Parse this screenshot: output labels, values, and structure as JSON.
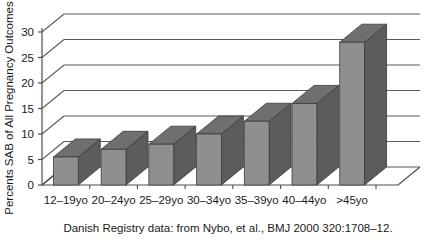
{
  "chart_data": {
    "type": "bar",
    "title": "",
    "subtitle": "",
    "xlabel": "",
    "ylabel": "Percents SAB of All Pregnancy Outcomes",
    "categories": [
      "12–19yo",
      "20–24yo",
      "25–29yo",
      "30–34yo",
      "35–39yo",
      "40–44yo",
      ">45yo"
    ],
    "values": [
      5.5,
      7,
      8,
      10,
      12.5,
      16,
      28
    ],
    "ylim": [
      0,
      30
    ],
    "yticks": [
      0,
      5,
      10,
      15,
      20,
      25,
      30
    ],
    "ytick_labels": [
      "0",
      "5",
      "10",
      "15",
      "20",
      "25",
      "30"
    ],
    "grid": true,
    "legend": false,
    "legend_position": "none",
    "annotations": [
      "Danish Registry data: from Nybo, et al., BMJ 2000 320:1708–12."
    ],
    "style": "3d-column",
    "bar_face_color": "#8f8f8f",
    "bar_side_color": "#5c5c5c",
    "bar_top_color": "#6f6f6f",
    "axis_color": "#4d4d4d",
    "grid_color": "#5a5a5a",
    "background_color": "#ffffff"
  },
  "caption": {
    "source_note": "Danish Registry data: from Nybo, et al., BMJ 2000 320:1708–12."
  },
  "axes": {
    "y_title": "Percents SAB of All Pregnancy Outcomes"
  }
}
